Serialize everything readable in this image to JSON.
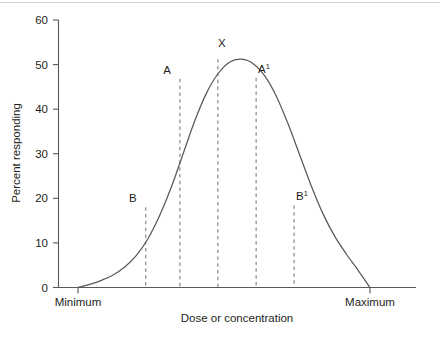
{
  "chart_data": {
    "type": "line",
    "title": "",
    "xlabel": "Dose or concentration",
    "ylabel": "Percent responding",
    "ylim": [
      0,
      60
    ],
    "yticks": [
      0,
      10,
      20,
      30,
      40,
      50,
      60
    ],
    "ytick_labels": [
      "0",
      "10",
      "20",
      "30",
      "40",
      "50",
      "60"
    ],
    "xtick_labels": [
      "Minimum",
      "Maximum"
    ],
    "grid": false,
    "legend": "none",
    "series": [
      {
        "name": "Dose-response distribution",
        "x": [
          0.0,
          0.04,
          0.08,
          0.12,
          0.16,
          0.2,
          0.24,
          0.28,
          0.32,
          0.36,
          0.4,
          0.44,
          0.48,
          0.52,
          0.56,
          0.6,
          0.64,
          0.68,
          0.72,
          0.76,
          0.8,
          0.84,
          0.88,
          0.92,
          0.96,
          1.0
        ],
        "y": [
          0.0,
          0.7,
          1.6,
          2.8,
          4.6,
          7.2,
          11.0,
          16.2,
          22.6,
          30.0,
          37.4,
          43.6,
          48.0,
          50.6,
          51.2,
          50.2,
          47.4,
          42.8,
          36.6,
          29.6,
          22.6,
          16.4,
          11.4,
          7.4,
          3.8,
          0.0
        ]
      }
    ],
    "annotations": [
      {
        "id": "B",
        "label": "B",
        "label_sup": "",
        "x_frac": 0.232,
        "y_value": 18.0,
        "has_dashed_line": true
      },
      {
        "id": "A",
        "label": "A",
        "label_sup": "",
        "x_frac": 0.349,
        "y_value": 46.8,
        "has_dashed_line": true
      },
      {
        "id": "X",
        "label": "X",
        "label_sup": "",
        "x_frac": 0.479,
        "y_value": 51.2,
        "has_dashed_line": true
      },
      {
        "id": "A1",
        "label": "A",
        "label_sup": "1",
        "x_frac": 0.61,
        "y_value": 47.0,
        "has_dashed_line": true
      },
      {
        "id": "B1",
        "label": "B",
        "label_sup": "1",
        "x_frac": 0.74,
        "y_value": 18.4,
        "has_dashed_line": true
      }
    ],
    "colors": {
      "curve": "#58595b",
      "axis": "#58595b",
      "dashed": "#6d6e71",
      "text": "#231f20",
      "background": "#ffffff"
    }
  }
}
